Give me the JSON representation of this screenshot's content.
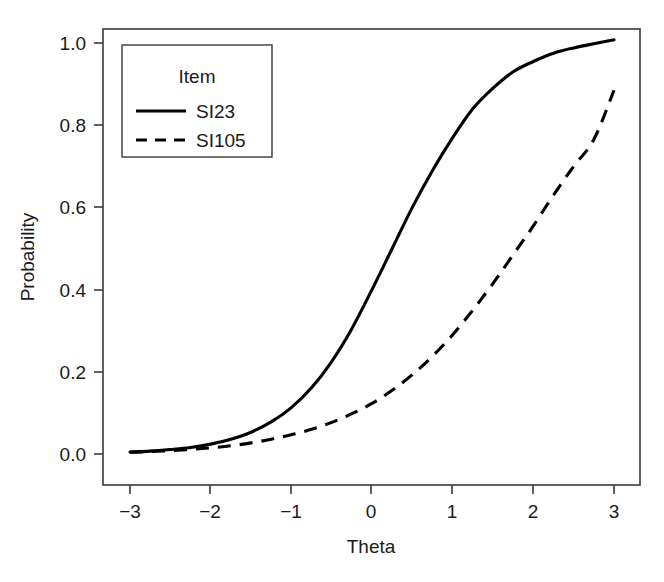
{
  "chart_data": {
    "type": "line",
    "title": "",
    "xlabel": "Theta",
    "ylabel": "Probability",
    "xlim": [
      -3,
      3
    ],
    "ylim": [
      0.0,
      1.0
    ],
    "xticks": [
      -3,
      -2,
      -1,
      0,
      1,
      2,
      3
    ],
    "xtick_labels": [
      "−3",
      "−2",
      "−1",
      "0",
      "1",
      "2",
      "3"
    ],
    "yticks": [
      0.0,
      0.2,
      0.4,
      0.6,
      0.8,
      1.0
    ],
    "ytick_labels": [
      "0.0",
      "0.2",
      "0.4",
      "0.6",
      "0.8",
      "1.0"
    ],
    "grid": false,
    "legend_title": "Item",
    "legend_position": "top-left",
    "x": [
      -3.0,
      -2.75,
      -2.5,
      -2.25,
      -2.0,
      -1.75,
      -1.5,
      -1.25,
      -1.0,
      -0.75,
      -0.5,
      -0.25,
      0.0,
      0.25,
      0.5,
      0.75,
      1.0,
      1.25,
      1.5,
      1.75,
      2.0,
      2.25,
      2.5,
      2.75,
      3.0
    ],
    "series": [
      {
        "name": "SI23",
        "style": "solid",
        "color": "#000000",
        "values": [
          0.005,
          0.007,
          0.011,
          0.016,
          0.024,
          0.036,
          0.053,
          0.078,
          0.113,
          0.161,
          0.225,
          0.305,
          0.4,
          0.5,
          0.6,
          0.69,
          0.77,
          0.84,
          0.89,
          0.93,
          0.955,
          0.975,
          0.988,
          0.998,
          1.008
        ]
      },
      {
        "name": "SI105",
        "style": "dashed",
        "color": "#000000",
        "values": [
          0.004,
          0.006,
          0.008,
          0.011,
          0.015,
          0.02,
          0.027,
          0.036,
          0.047,
          0.06,
          0.077,
          0.098,
          0.123,
          0.155,
          0.193,
          0.238,
          0.29,
          0.35,
          0.415,
          0.485,
          0.555,
          0.63,
          0.7,
          0.765,
          0.885
        ]
      }
    ],
    "legend_entries": [
      {
        "label": "SI23",
        "style": "solid"
      },
      {
        "label": "SI105",
        "style": "dashed"
      }
    ]
  }
}
